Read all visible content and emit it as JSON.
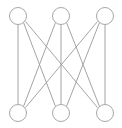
{
  "figure": {
    "background_color": "#ffffff",
    "width": 122,
    "height": 128
  },
  "chart_data": {
    "type": "diagram",
    "diagram_kind": "graph",
    "graph_name": "K3,3",
    "title": "",
    "directed": false,
    "bipartite": true,
    "node_count": 6,
    "edge_count": 9,
    "node_radius": 8.5,
    "node_fill": "#ffffff",
    "node_stroke": "#a8a8a8",
    "node_stroke_width": 1.0,
    "edge_stroke": "#9a9a9a",
    "edge_stroke_width": 0.9,
    "partitions": [
      {
        "name": "top",
        "nodes": [
          "t1",
          "t2",
          "t3"
        ]
      },
      {
        "name": "bottom",
        "nodes": [
          "b1",
          "b2",
          "b3"
        ]
      }
    ],
    "nodes": [
      {
        "id": "t1",
        "label": "",
        "x": 18,
        "y": 16,
        "partition": "top"
      },
      {
        "id": "t2",
        "label": "",
        "x": 61,
        "y": 16,
        "partition": "top"
      },
      {
        "id": "t3",
        "label": "",
        "x": 105,
        "y": 16,
        "partition": "top"
      },
      {
        "id": "b1",
        "label": "",
        "x": 18,
        "y": 113,
        "partition": "bottom"
      },
      {
        "id": "b2",
        "label": "",
        "x": 61,
        "y": 113,
        "partition": "bottom"
      },
      {
        "id": "b3",
        "label": "",
        "x": 105,
        "y": 113,
        "partition": "bottom"
      }
    ],
    "edges": [
      {
        "source": "t1",
        "target": "b1",
        "x1": 18,
        "y1": 24.5,
        "x2": 18,
        "y2": 104.5
      },
      {
        "source": "t1",
        "target": "b2",
        "x1": 23.5,
        "y1": 22.5,
        "x2": 55.5,
        "y2": 106.5
      },
      {
        "source": "t1",
        "target": "b3",
        "x1": 25.5,
        "y1": 21.5,
        "x2": 97.5,
        "y2": 107.5
      },
      {
        "source": "t2",
        "target": "b1",
        "x1": 55.5,
        "y1": 22.5,
        "x2": 23.5,
        "y2": 106.5
      },
      {
        "source": "t2",
        "target": "b2",
        "x1": 61,
        "y1": 24.5,
        "x2": 61,
        "y2": 104.5
      },
      {
        "source": "t2",
        "target": "b3",
        "x1": 66.5,
        "y1": 22.5,
        "x2": 99.5,
        "y2": 106.5
      },
      {
        "source": "t3",
        "target": "b1",
        "x1": 97.5,
        "y1": 21.5,
        "x2": 25.5,
        "y2": 107.5
      },
      {
        "source": "t3",
        "target": "b2",
        "x1": 99.5,
        "y1": 22.5,
        "x2": 66.5,
        "y2": 106.5
      },
      {
        "source": "t3",
        "target": "b3",
        "x1": 105,
        "y1": 24.5,
        "x2": 105,
        "y2": 104.5
      }
    ]
  }
}
